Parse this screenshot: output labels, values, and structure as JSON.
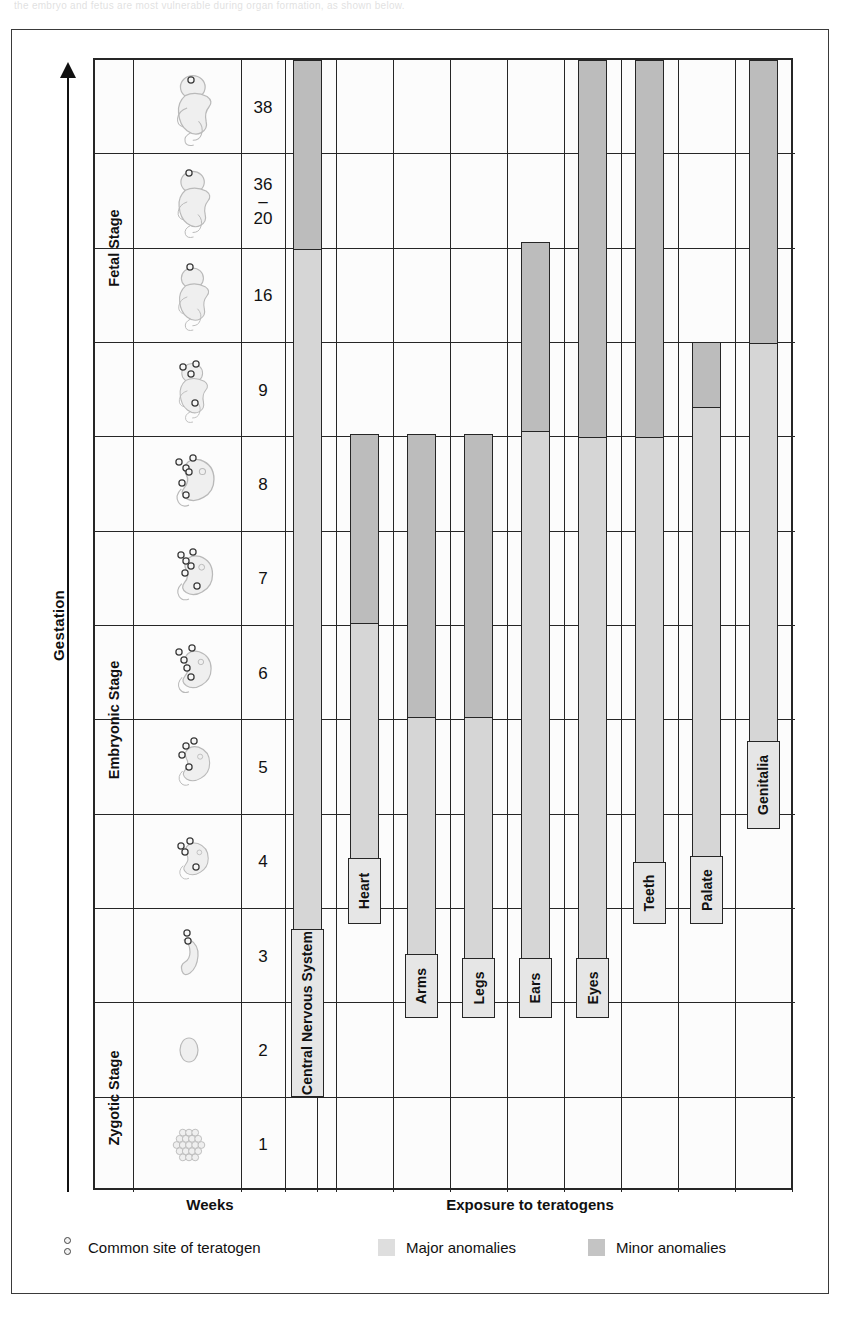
{
  "page": {
    "ghost_top_text": "the embryo and fetus are most vulnerable during organ formation, as shown below."
  },
  "axis": {
    "label": "Gestation"
  },
  "captions": {
    "weeks": "Weeks",
    "exposure": "Exposure to teratogens"
  },
  "legend": {
    "items": [
      {
        "swatch": "teratogen-dots",
        "label": "Common site of teratogen"
      },
      {
        "swatch": "major",
        "label": "Major anomalies",
        "color": "#dedede"
      },
      {
        "swatch": "minor",
        "label": "Minor anomalies",
        "color": "#c4c4c4"
      }
    ]
  },
  "stages": [
    {
      "name": "Fetal Stage",
      "rows": 4
    },
    {
      "name": "Embryonic Stage",
      "rows": 6
    },
    {
      "name": "Zygotic Stage",
      "rows": 2
    }
  ],
  "rows": [
    {
      "week": "38",
      "week_lines": [
        "38"
      ],
      "stage": "Fetal Stage"
    },
    {
      "week": "36 - 20",
      "week_lines": [
        "36",
        "–",
        "20"
      ],
      "stage": "Fetal Stage"
    },
    {
      "week": "16",
      "week_lines": [
        "16"
      ],
      "stage": "Fetal Stage"
    },
    {
      "week": "9",
      "week_lines": [
        "9"
      ],
      "stage": "Fetal Stage"
    },
    {
      "week": "8",
      "week_lines": [
        "8"
      ],
      "stage": "Embryonic Stage"
    },
    {
      "week": "7",
      "week_lines": [
        "7"
      ],
      "stage": "Embryonic Stage"
    },
    {
      "week": "6",
      "week_lines": [
        "6"
      ],
      "stage": "Embryonic Stage"
    },
    {
      "week": "5",
      "week_lines": [
        "5"
      ],
      "stage": "Embryonic Stage"
    },
    {
      "week": "4",
      "week_lines": [
        "4"
      ],
      "stage": "Embryonic Stage"
    },
    {
      "week": "3",
      "week_lines": [
        "3"
      ],
      "stage": "Embryonic Stage"
    },
    {
      "week": "2",
      "week_lines": [
        "2"
      ],
      "stage": "Zygotic Stage"
    },
    {
      "week": "1",
      "week_lines": [
        "1"
      ],
      "stage": "Zygotic Stage"
    }
  ],
  "chart_data": {
    "type": "bar",
    "xlabel": "Exposure to teratogens",
    "ylabel": "Weeks",
    "categories": [
      "Central Nervous System",
      "Heart",
      "Arms",
      "Legs",
      "Ears",
      "Eyes",
      "Teeth",
      "Palate",
      "Genitalia"
    ],
    "y_tick_labels": [
      "38",
      "36 - 20",
      "16",
      "9",
      "8",
      "7",
      "6",
      "5",
      "4",
      "3",
      "2",
      "1"
    ],
    "legend": [
      "Major anomalies",
      "Minor anomalies",
      "Common site of teratogen"
    ],
    "legend_position": "bottom",
    "grid": true,
    "series": [
      {
        "name": "Central Nervous System",
        "minor_weeks": [
          "38",
          "36 - 20"
        ],
        "major_weeks": [
          "16",
          "9",
          "8",
          "7",
          "6",
          "5",
          "4",
          "3"
        ],
        "start_week": "3",
        "end_week": "38"
      },
      {
        "name": "Heart",
        "minor_weeks": [
          "8",
          "7"
        ],
        "major_weeks": [
          "6",
          "5",
          "4",
          "3"
        ],
        "start_week": "3",
        "end_week": "8"
      },
      {
        "name": "Arms",
        "minor_weeks": [
          "8",
          "7",
          "6"
        ],
        "major_weeks": [
          "5",
          "4"
        ],
        "start_week": "4",
        "end_week": "8"
      },
      {
        "name": "Legs",
        "minor_weeks": [
          "8",
          "7",
          "6"
        ],
        "major_weeks": [
          "5",
          "4"
        ],
        "start_week": "4",
        "end_week": "8"
      },
      {
        "name": "Ears",
        "minor_weeks": [
          "16",
          "9"
        ],
        "major_weeks": [
          "8",
          "7",
          "6",
          "5",
          "4"
        ],
        "start_week": "4",
        "end_week": "16"
      },
      {
        "name": "Eyes",
        "minor_weeks": [
          "38",
          "36 - 20",
          "16",
          "9"
        ],
        "major_weeks": [
          "8",
          "7",
          "6",
          "5",
          "4"
        ],
        "start_week": "4",
        "end_week": "38"
      },
      {
        "name": "Teeth",
        "minor_weeks": [
          "16",
          "9"
        ],
        "major_weeks": [
          "8",
          "7"
        ],
        "start_week": "7",
        "end_week": "16"
      },
      {
        "name": "Palate",
        "minor_weeks": [
          "9"
        ],
        "major_weeks": [
          "8",
          "7"
        ],
        "start_week": "7",
        "end_week": "9"
      },
      {
        "name": "Genitalia",
        "minor_weeks": [
          "38",
          "36 - 20",
          "16"
        ],
        "major_weeks": [
          "9",
          "8",
          "7",
          "6"
        ],
        "start_week": "6",
        "end_week": "38"
      }
    ],
    "colors": {
      "minor": "#bcbcbc",
      "major": "#d6d6d6",
      "grid": "#262626"
    }
  },
  "bars": [
    {
      "name": "Central Nervous System",
      "label": "Central Nervous System",
      "x": 198,
      "w": 29,
      "top": 0,
      "bottom": 1037,
      "split": 188,
      "label_h": 168
    },
    {
      "name": "Heart",
      "label": "Heart",
      "x": 255,
      "w": 29,
      "top": 374,
      "bottom": 864,
      "split": 188,
      "label_h": 66
    },
    {
      "name": "Arms",
      "label": "Arms",
      "x": 312,
      "w": 29,
      "top": 374,
      "bottom": 958,
      "split": 282,
      "label_h": 64
    },
    {
      "name": "Legs",
      "label": "Legs",
      "x": 369,
      "w": 29,
      "top": 374,
      "bottom": 958,
      "split": 282,
      "label_h": 60
    },
    {
      "name": "Ears",
      "label": "Ears",
      "x": 426,
      "w": 29,
      "top": 182,
      "bottom": 958,
      "split": 188,
      "label_h": 60
    },
    {
      "name": "Eyes",
      "label": "Eyes",
      "x": 483,
      "w": 29,
      "top": 0,
      "bottom": 958,
      "split": 376,
      "label_h": 60
    },
    {
      "name": "Teeth",
      "label": "Teeth",
      "x": 540,
      "w": 29,
      "top": 0,
      "bottom": 864,
      "split": 376,
      "label_h": 62
    },
    {
      "name": "Palate",
      "label": "Palate",
      "x": 597,
      "w": 29,
      "top": 282,
      "bottom": 864,
      "split": 64,
      "label_h": 68
    },
    {
      "name": "Genitalia",
      "label": "Genitalia",
      "x": 654,
      "w": 29,
      "top": 0,
      "bottom": 769,
      "split": 282,
      "label_h": 88
    }
  ]
}
